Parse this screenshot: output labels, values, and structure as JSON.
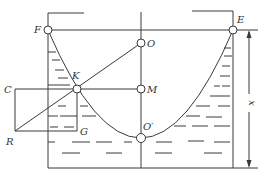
{
  "diagram": {
    "points": {
      "F": "F",
      "E": "E",
      "O": "O",
      "K": "K",
      "M": "M",
      "C": "C",
      "R": "R",
      "G": "G",
      "O_prime": "O′"
    },
    "dimension_label": "x",
    "colors": {
      "line": "#3a3a3a",
      "background": "#ffffff"
    }
  }
}
